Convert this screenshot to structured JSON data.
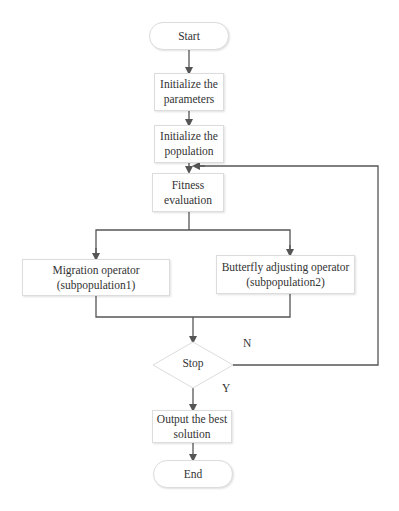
{
  "flowchart": {
    "nodes": {
      "start": "Start",
      "init_params_l1": "Initialize the",
      "init_params_l2": "parameters",
      "init_pop_l1": "Initialize the",
      "init_pop_l2": "population",
      "fitness_l1": "Fitness",
      "fitness_l2": "evaluation",
      "migration_l1": "Migration operator",
      "migration_l2": "(subpopulation1)",
      "butterfly_l1": "Butterfly adjusting operator",
      "butterfly_l2": "(subpopulation2)",
      "stop": "Stop",
      "output_l1": "Output the best",
      "output_l2": "solution",
      "end": "End"
    },
    "edge_labels": {
      "no": "N",
      "yes": "Y"
    },
    "colors": {
      "line": "#555555",
      "border": "#dcdcdc",
      "text": "#333333"
    }
  }
}
